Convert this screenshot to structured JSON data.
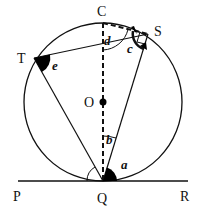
{
  "diagram": {
    "type": "circle-geometry",
    "points": {
      "C": {
        "label": "C"
      },
      "S": {
        "label": "S"
      },
      "T": {
        "label": "T"
      },
      "O": {
        "label": "O"
      },
      "P": {
        "label": "P"
      },
      "Q": {
        "label": "Q"
      },
      "R": {
        "label": "R"
      }
    },
    "angles": {
      "a": {
        "label": "a",
        "at": "Q",
        "between": "QS and QR"
      },
      "b": {
        "label": "b",
        "at": "Q",
        "between": "QC and QS"
      },
      "c": {
        "label": "c",
        "at": "S",
        "between": "SC and SQ"
      },
      "d": {
        "label": "d",
        "at": "C",
        "between": "CQ and CS"
      },
      "e": {
        "label": "e",
        "at": "T",
        "between": "TS and TQ"
      }
    },
    "colors": {
      "stroke": "#111111",
      "fill": "#000000",
      "background": "#ffffff"
    }
  }
}
